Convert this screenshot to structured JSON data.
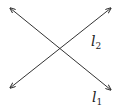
{
  "diagram": {
    "type": "intersecting-lines",
    "line_color": "#333333",
    "background": "#ffffff",
    "lines": [
      {
        "id": "l1",
        "label_base": "l",
        "label_sub": "1",
        "from": [
          10,
          8
        ],
        "to": [
          111,
          90
        ],
        "arrows": "both",
        "label_pos": [
          92,
          102
        ]
      },
      {
        "id": "l2",
        "label_base": "l",
        "label_sub": "2",
        "from": [
          10,
          88
        ],
        "to": [
          111,
          8
        ],
        "arrows": "both",
        "label_pos": [
          91,
          46
        ]
      }
    ],
    "intersection": [
      61,
      49
    ]
  }
}
